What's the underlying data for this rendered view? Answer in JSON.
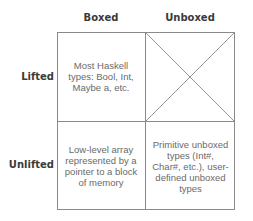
{
  "columns": [
    {
      "label": "Boxed"
    },
    {
      "label": "Unboxed"
    }
  ],
  "rows": [
    {
      "label": "Lifted"
    },
    {
      "label": "Unlifted"
    }
  ],
  "cells": {
    "lifted_boxed": "Most Haskell types: Bool, Int, Maybe a, etc.",
    "lifted_unboxed": "",
    "unlifted_boxed": "Low-level array represented by a pointer to a block of memory",
    "unlifted_unboxed": "Primitive unboxed types (Int#, Char#, etc.), user-defined unboxed types"
  },
  "empty_cell_marker": "crossed-out (X)",
  "colors": {
    "line": "#8a8a8a",
    "header_text": "#3a3a3a",
    "cell_text": "#6a6a6a"
  }
}
